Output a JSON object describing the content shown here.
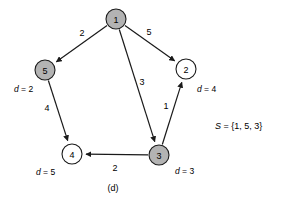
{
  "figure": {
    "caption": "(d)",
    "set_var": "S",
    "set_eq": " = {1, 5, 3}"
  },
  "nodes": [
    {
      "id": "1",
      "label": "1",
      "cx": 116,
      "cy": 19,
      "r": 10,
      "shaded": true,
      "dist": null
    },
    {
      "id": "2",
      "label": "2",
      "cx": 186,
      "cy": 69,
      "r": 10,
      "shaded": false,
      "dist": "4"
    },
    {
      "id": "3",
      "label": "3",
      "cx": 159,
      "cy": 155,
      "r": 10,
      "shaded": true,
      "dist": "3"
    },
    {
      "id": "4",
      "label": "4",
      "cx": 72,
      "cy": 154,
      "r": 10,
      "shaded": false,
      "dist": "5"
    },
    {
      "id": "5",
      "label": "5",
      "cx": 45,
      "cy": 70,
      "r": 10,
      "shaded": true,
      "dist": "2"
    }
  ],
  "dist_labels": [
    {
      "node": "5",
      "var": "d",
      "eq": " = 2",
      "x": 14,
      "y": 89
    },
    {
      "node": "2",
      "var": "d",
      "eq": " = 4",
      "x": 197,
      "y": 89
    },
    {
      "node": "4",
      "var": "d",
      "eq": " = 5",
      "x": 36,
      "y": 172
    },
    {
      "node": "3",
      "var": "d",
      "eq": " = 3",
      "x": 175,
      "y": 171
    }
  ],
  "edges": [
    {
      "id": "e-1-5",
      "from": "1",
      "to": "5",
      "weight": "2",
      "wx": 82,
      "wy": 33
    },
    {
      "id": "e-1-2",
      "from": "1",
      "to": "2",
      "weight": "5",
      "wx": 149,
      "wy": 32
    },
    {
      "id": "e-1-3",
      "from": "1",
      "to": "3",
      "weight": "3",
      "wx": 142,
      "wy": 82
    },
    {
      "id": "e-3-2",
      "from": "3",
      "to": "2",
      "weight": "1",
      "wx": 166,
      "wy": 106
    },
    {
      "id": "e-5-4",
      "from": "5",
      "to": "4",
      "weight": "4",
      "wx": 47,
      "wy": 108
    },
    {
      "id": "e-3-4",
      "from": "3",
      "to": "4",
      "weight": "2",
      "wx": 115,
      "wy": 168
    }
  ],
  "set_text": {
    "x": 215,
    "y": 126
  },
  "caption_pos": {
    "x": 113,
    "y": 188
  },
  "colors": {
    "shaded_node": "#b3b3b3",
    "plain_node": "#ffffff",
    "stroke": "#1a1a1a",
    "background": "#ffffff"
  }
}
